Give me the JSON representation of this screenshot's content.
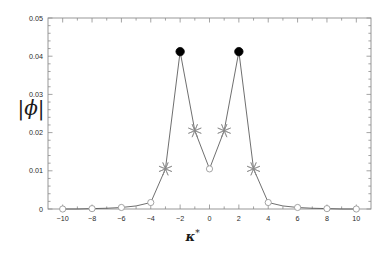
{
  "figure": {
    "background": "#ffffff",
    "frame_color": "#8d8d8d",
    "line_color": "#4a4a4a",
    "marker_open_color": "#9a9a9a",
    "marker_filled_color": "#000000",
    "star_color": "#8a8a8a",
    "text_color": "#2b2b2b"
  },
  "axes": {
    "xlabel": "κ",
    "xlabel_superscript": "*",
    "ylabel": "|ϕ|",
    "x_ticks": [
      "-10",
      "-8",
      "-6",
      "-4",
      "-2",
      "0",
      "2",
      "4",
      "6",
      "8",
      "10"
    ],
    "y_ticks": [
      "0",
      "0.01",
      "0.02",
      "0.03",
      "0.04",
      "0.05"
    ],
    "xlim": [
      -11,
      11
    ],
    "ylim": [
      0,
      0.05
    ],
    "grid": "off",
    "frame": "box-all-sides",
    "minor_ticks": "true"
  },
  "chart_data": {
    "type": "line",
    "title": "",
    "xlabel": "κ*",
    "ylabel": "|ϕ|",
    "xlim": [
      -11,
      11
    ],
    "ylim": [
      0,
      0.05
    ],
    "grid": false,
    "legend": "none",
    "x": [
      -10,
      -9,
      -8,
      -7,
      -6,
      -5,
      -4,
      -3,
      -2,
      -1,
      0,
      1,
      2,
      3,
      4,
      5,
      6,
      7,
      8,
      9,
      10
    ],
    "values": [
      0.0,
      0.0,
      0.0001,
      0.0002,
      0.0004,
      0.0008,
      0.0017,
      0.0105,
      0.0412,
      0.0205,
      0.0105,
      0.0205,
      0.0412,
      0.0105,
      0.0017,
      0.0008,
      0.0004,
      0.0002,
      0.0001,
      0.0,
      0.0
    ],
    "markers": [
      {
        "x": -10,
        "y": 0.0,
        "style": "open-circle"
      },
      {
        "x": -8,
        "y": 0.0001,
        "style": "open-circle"
      },
      {
        "x": -6,
        "y": 0.0004,
        "style": "open-circle"
      },
      {
        "x": -4,
        "y": 0.0017,
        "style": "open-circle"
      },
      {
        "x": -3,
        "y": 0.0105,
        "style": "star"
      },
      {
        "x": -2,
        "y": 0.0412,
        "style": "filled-circle"
      },
      {
        "x": -1,
        "y": 0.0205,
        "style": "star"
      },
      {
        "x": 0,
        "y": 0.0105,
        "style": "open-circle"
      },
      {
        "x": 1,
        "y": 0.0205,
        "style": "star"
      },
      {
        "x": 2,
        "y": 0.0412,
        "style": "filled-circle"
      },
      {
        "x": 3,
        "y": 0.0105,
        "style": "star"
      },
      {
        "x": 4,
        "y": 0.0017,
        "style": "open-circle"
      },
      {
        "x": 6,
        "y": 0.0004,
        "style": "open-circle"
      },
      {
        "x": 8,
        "y": 0.0001,
        "style": "open-circle"
      },
      {
        "x": 10,
        "y": 0.0,
        "style": "open-circle"
      }
    ]
  }
}
